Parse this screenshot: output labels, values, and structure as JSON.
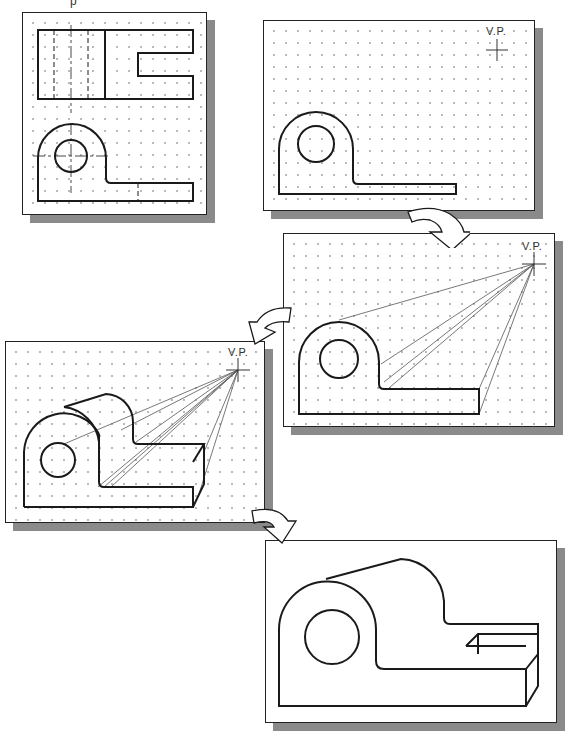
{
  "caption": "p",
  "steps": [
    {
      "id": 1,
      "title": "Multiview drawing (top and front views)"
    },
    {
      "id": 2,
      "title": "Front view with vanishing point",
      "vp_label": "V.P."
    },
    {
      "id": 3,
      "title": "Projection lines to vanishing point",
      "vp_label": "V.P."
    },
    {
      "id": 4,
      "title": "Depth established along projection lines",
      "vp_label": "V.P."
    },
    {
      "id": 5,
      "title": "Completed one-point perspective"
    }
  ],
  "colors": {
    "line": "#1a1a1a",
    "projection_line": "#555555",
    "grid_dot": "#b9b9b9",
    "shadow": "#8a8a8a",
    "arrow_fill": "#ffffff"
  }
}
